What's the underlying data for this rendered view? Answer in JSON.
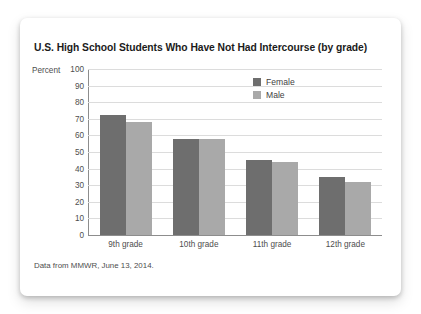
{
  "card": {
    "source_note": "Data from MMWR, June 13, 2014."
  },
  "legend": {
    "items": [
      {
        "label": "Female",
        "color": "#6e6e6e"
      },
      {
        "label": "Male",
        "color": "#a9a9a9"
      }
    ]
  },
  "chart_data": {
    "type": "bar",
    "title": "U.S. High School Students Who Have Not Had Intercourse (by grade)",
    "xlabel": "",
    "ylabel": "Percent",
    "ylim": [
      0,
      100
    ],
    "ytick_step": 10,
    "yticks": [
      "100",
      "90",
      "80",
      "70",
      "60",
      "50",
      "40",
      "30",
      "20",
      "10",
      "0"
    ],
    "grid": true,
    "legend_position": "top-right inside plot",
    "categories": [
      "9th grade",
      "10th grade",
      "11th grade",
      "12th grade"
    ],
    "series": [
      {
        "name": "Female",
        "color": "#6e6e6e",
        "values": [
          72,
          58,
          45,
          35
        ]
      },
      {
        "name": "Male",
        "color": "#a9a9a9",
        "values": [
          68,
          58,
          44,
          32
        ]
      }
    ]
  }
}
